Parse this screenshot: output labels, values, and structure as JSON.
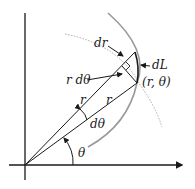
{
  "diagram": {
    "title": "",
    "labels": {
      "dr": "dr",
      "dL": "dL",
      "r_dtheta": "r dθ",
      "point": "(r, θ)",
      "r_upper": "r",
      "r_lower": "r",
      "dtheta": "dθ",
      "theta": "θ"
    },
    "colors": {
      "line": "#1a1a1a",
      "arc": "#999999",
      "dotted_arc": "#aaaaaa",
      "background": "#ffffff"
    }
  }
}
